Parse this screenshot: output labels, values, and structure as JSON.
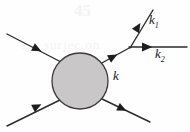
{
  "figure": {
    "kind": "feynman-scattering-diagram",
    "width": 190,
    "height": 132,
    "background_color": "#fefefe",
    "line_color": "#2b2b2b",
    "blob": {
      "name": "interaction-blob",
      "shape": "circle",
      "cx": 80,
      "cy": 81,
      "r": 28,
      "fill_color": "#c9c7c7",
      "stroke_color": "#3a3a3a"
    },
    "labels": {
      "k": "k",
      "k1_base": "k",
      "k1_sub": "1",
      "k2_base": "k",
      "k2_sub": "2"
    },
    "lines": [
      {
        "name": "incoming-line-upper-left",
        "x1": 7,
        "y1": 34,
        "x2": 60,
        "y2": 61,
        "arrow_at_x": 31,
        "arrow_at_y": 46,
        "arrow_direction": "down-right",
        "label": ""
      },
      {
        "name": "incoming-line-lower-left",
        "x1": 7,
        "y1": 126,
        "x2": 59,
        "y2": 100,
        "arrow_at_x": 31,
        "arrow_at_y": 109,
        "arrow_direction": "up-right",
        "label": ""
      },
      {
        "name": "outgoing-line-lower-right",
        "x1": 101,
        "y1": 99,
        "x2": 149,
        "y2": 122,
        "arrow_at_x": 120,
        "arrow_at_y": 108,
        "arrow_direction": "down-right",
        "label": ""
      },
      {
        "name": "internal-line-k",
        "x1": 101,
        "y1": 63,
        "x2": 130,
        "y2": 47,
        "arrow_at_x": 112,
        "arrow_at_y": 57,
        "arrow_direction": "up-right",
        "label": "k"
      },
      {
        "name": "outgoing-line-k1",
        "x1": 130,
        "y1": 47,
        "x2": 152,
        "y2": 11,
        "arrow_at_x": 139,
        "arrow_at_y": 27,
        "arrow_direction": "up-right",
        "label": "k1"
      },
      {
        "name": "outgoing-line-k2",
        "x1": 130,
        "y1": 47,
        "x2": 186,
        "y2": 47,
        "arrow_at_x": 148,
        "arrow_at_y": 47,
        "arrow_direction": "right",
        "label": "k2"
      }
    ],
    "vertex": {
      "name": "decay-vertex",
      "x": 130,
      "y": 47
    },
    "background_ghost_text": {
      "line_a": "45",
      "line_b": "La",
      "line_c": "surjec on"
    }
  }
}
